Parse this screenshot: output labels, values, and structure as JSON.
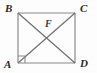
{
  "figure": {
    "kind": "geometry-diagram",
    "background_color": "#fdfdfd",
    "stroke_color": "#8a8a8a",
    "diagonal_color": "#6f6f6f",
    "label_color": "#2b2b2b",
    "stroke_width": 1.2,
    "canvas": {
      "width": 97,
      "height": 73
    },
    "square": {
      "name": "ABCD",
      "left": 18,
      "top": 13,
      "right": 75,
      "bottom": 63,
      "side_px": 57
    },
    "vertices": [
      {
        "id": "B",
        "label": "B",
        "x": 18,
        "y": 13,
        "position": "top-left"
      },
      {
        "id": "C",
        "label": "C",
        "x": 75,
        "y": 13,
        "position": "top-right"
      },
      {
        "id": "D",
        "label": "D",
        "x": 75,
        "y": 63,
        "position": "bottom-right"
      },
      {
        "id": "A",
        "label": "A",
        "x": 18,
        "y": 63,
        "position": "bottom-left"
      }
    ],
    "interior_point": {
      "id": "F",
      "label": "F",
      "x": 46,
      "y": 38,
      "note": "intersection of diagonals"
    },
    "segments": [
      {
        "name": "side-BC",
        "from": "B",
        "to": "C",
        "style": "solid"
      },
      {
        "name": "side-CD",
        "from": "C",
        "to": "D",
        "style": "solid"
      },
      {
        "name": "side-DA",
        "from": "D",
        "to": "A",
        "style": "solid"
      },
      {
        "name": "side-AB",
        "from": "A",
        "to": "B",
        "style": "solid"
      },
      {
        "name": "diagonal-BD",
        "from": "B",
        "to": "D",
        "style": "solid"
      },
      {
        "name": "diagonal-AC",
        "from": "A",
        "to": "C",
        "style": "solid"
      }
    ],
    "right_angle_mark": {
      "at_vertex": "A",
      "size_px": 7
    }
  }
}
